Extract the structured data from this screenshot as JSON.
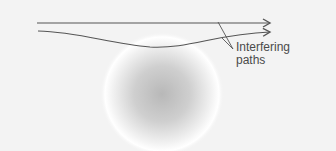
{
  "diagram": {
    "label_line1": "Interfering",
    "label_line2": "paths",
    "colors": {
      "background": "#f3f3f3",
      "line": "#555555",
      "mass_center": "#bdbdbd",
      "mass_halo": "#ffffff",
      "text": "#4a4a4a"
    },
    "elements": [
      {
        "type": "straight-path",
        "from": [
          37,
          23
        ],
        "to": [
          270,
          23
        ],
        "arrow": true
      },
      {
        "type": "curved-path",
        "from": [
          38,
          31
        ],
        "via": [
          150,
          47
        ],
        "to": [
          270,
          32
        ],
        "arrow": true
      },
      {
        "type": "mass-sphere",
        "center": [
          160,
          92
        ],
        "radius": 58
      },
      {
        "type": "leader-line",
        "from": [
          218,
          22
        ],
        "to": [
          233,
          49
        ]
      },
      {
        "type": "leader-line",
        "from": [
          222,
          38
        ],
        "to": [
          233,
          49
        ]
      }
    ]
  }
}
